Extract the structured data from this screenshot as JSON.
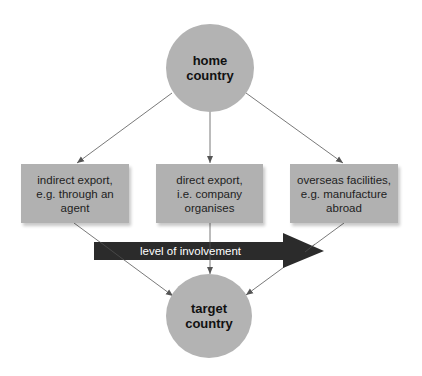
{
  "diagram": {
    "type": "flow",
    "nodes": {
      "home": {
        "lines": [
          "home",
          "country"
        ],
        "fill": "#b3b3b3"
      },
      "target": {
        "lines": [
          "target",
          "country"
        ],
        "fill": "#b3b3b3"
      },
      "boxes": [
        {
          "id": "indirect-export",
          "lines": [
            "indirect export,",
            "e.g. through an",
            "agent"
          ]
        },
        {
          "id": "direct-export",
          "lines": [
            "direct export,",
            "i.e. company",
            "organises"
          ]
        },
        {
          "id": "overseas-facilities",
          "lines": [
            "overseas facilities,",
            "e.g. manufacture",
            "abroad"
          ]
        }
      ]
    },
    "involvement_arrow": {
      "label": "level of involvement",
      "fill": "#2b2b2b",
      "text_color": "#ffffff",
      "direction": "left-to-right"
    },
    "edges": [
      {
        "from": "home",
        "to": "indirect-export"
      },
      {
        "from": "home",
        "to": "direct-export"
      },
      {
        "from": "home",
        "to": "overseas-facilities"
      },
      {
        "from": "indirect-export",
        "to": "target"
      },
      {
        "from": "direct-export",
        "to": "target"
      },
      {
        "from": "overseas-facilities",
        "to": "target"
      }
    ],
    "colors": {
      "node_fill": "#b3b3b3",
      "box_fill": "#b1b1b1",
      "edge": "#6a6a6a",
      "arrow": "#2b2b2b"
    }
  }
}
